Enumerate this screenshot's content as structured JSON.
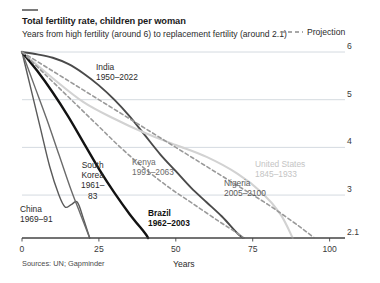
{
  "header": {
    "title": "Total fertility rate, children per woman",
    "subtitle": "Years from high fertility (around 6) to replacement fertility (around 2.1)"
  },
  "legend": {
    "projection_label": "Projection",
    "projection_icon": "dashed-line-icon",
    "projection_color": "#8c8c8c"
  },
  "footer": {
    "source": "Sources: UN; Gapminder"
  },
  "chart_data": {
    "type": "line",
    "title": "Total fertility rate, children per woman",
    "subtitle": "Years from high fertility (around 6) to replacement fertility (around 2.1)",
    "xlabel": "Years",
    "ylabel": "",
    "xlim": [
      0,
      105
    ],
    "ylim": [
      2.1,
      6
    ],
    "xticks": [
      0,
      25,
      50,
      75,
      100
    ],
    "xtick_labels": [
      "0",
      "25",
      "50",
      "75",
      "100"
    ],
    "yticks": [
      2.1,
      3,
      4,
      5,
      6
    ],
    "ytick_labels": [
      "2.1",
      "3",
      "4",
      "5",
      "6"
    ],
    "grid": "horizontal",
    "legend_position": "top-right",
    "series": [
      {
        "name": "India",
        "label": "India",
        "period": "1950–2022",
        "color": "#4a4a4a",
        "style": "solid",
        "width": 1.9,
        "x": [
          0,
          5,
          10,
          15,
          20,
          25,
          30,
          35,
          40,
          45,
          50,
          55,
          60,
          65,
          70,
          72
        ],
        "y": [
          6.0,
          5.95,
          5.88,
          5.75,
          5.55,
          5.3,
          5.0,
          4.65,
          4.25,
          3.85,
          3.5,
          3.15,
          2.85,
          2.55,
          2.2,
          2.1
        ]
      },
      {
        "name": "United States",
        "label": "United States",
        "period": "1845–1933",
        "color": "#d2d2d2",
        "style": "solid",
        "width": 2.1,
        "x": [
          0,
          10,
          20,
          30,
          40,
          50,
          60,
          70,
          78,
          84,
          88
        ],
        "y": [
          6.0,
          5.45,
          4.95,
          4.6,
          4.3,
          4.05,
          3.8,
          3.45,
          3.05,
          2.6,
          2.1
        ]
      },
      {
        "name": "China",
        "label": "China",
        "period": "1969–91",
        "color": "#5a5a5a",
        "style": "solid",
        "width": 1.4,
        "x": [
          0,
          3,
          6,
          9,
          12,
          14,
          16,
          18,
          20,
          22
        ],
        "y": [
          6.0,
          5.2,
          4.4,
          3.6,
          3.0,
          2.75,
          2.8,
          2.85,
          2.5,
          2.1
        ]
      },
      {
        "name": "South Korea",
        "label": "South Korea",
        "period": "1961–83",
        "color": "#6b6b6b",
        "style": "solid",
        "width": 1.4,
        "x": [
          0,
          4,
          8,
          12,
          16,
          19,
          22
        ],
        "y": [
          6.0,
          5.3,
          4.6,
          3.85,
          3.1,
          2.6,
          2.1
        ]
      },
      {
        "name": "Brazil",
        "label": "Brazil",
        "period": "1962–2003",
        "color": "#121212",
        "style": "solid",
        "width": 2.4,
        "x": [
          0,
          5,
          10,
          15,
          20,
          25,
          30,
          35,
          40,
          41
        ],
        "y": [
          6.0,
          5.6,
          5.15,
          4.65,
          4.1,
          3.55,
          3.05,
          2.6,
          2.2,
          2.1
        ]
      },
      {
        "name": "Kenya",
        "label": "Kenya",
        "period": "1991–2063",
        "color": "#9a9a9a",
        "style": "dashed",
        "width": 1.6,
        "x": [
          0,
          8,
          16,
          24,
          32,
          40,
          48,
          56,
          64,
          70,
          72
        ],
        "y": [
          6.0,
          5.5,
          5.0,
          4.5,
          4.0,
          3.55,
          3.15,
          2.8,
          2.45,
          2.2,
          2.1
        ]
      },
      {
        "name": "Nigeria",
        "label": "Nigeria",
        "period": "2005–2100",
        "color": "#9a9a9a",
        "style": "dashed",
        "width": 1.6,
        "x": [
          0,
          10,
          20,
          30,
          40,
          50,
          60,
          70,
          80,
          90,
          95
        ],
        "y": [
          6.0,
          5.6,
          5.2,
          4.8,
          4.4,
          4.0,
          3.6,
          3.2,
          2.8,
          2.35,
          2.1
        ]
      }
    ],
    "annotations": [
      {
        "name": "india",
        "lines": [
          "India",
          "1950–2022"
        ],
        "x": 96,
        "y": 62,
        "color": "#2b2b2b",
        "bold": false,
        "align": "left"
      },
      {
        "name": "united-states",
        "lines": [
          "United States",
          "1845–1933"
        ],
        "x": 255,
        "y": 159,
        "color": "#c4c4c4",
        "bold": false,
        "align": "left"
      },
      {
        "name": "kenya",
        "lines": [
          "Kenya",
          "1991–2063"
        ],
        "x": 132,
        "y": 157,
        "color": "#6b6b6b",
        "bold": false,
        "align": "left"
      },
      {
        "name": "nigeria",
        "lines": [
          "Nigeria",
          "2005–2100"
        ],
        "x": 224,
        "y": 178,
        "color": "#5a5a5a",
        "bold": false,
        "align": "left"
      },
      {
        "name": "south-korea",
        "lines": [
          "South",
          "Korea",
          "1961–",
          "83"
        ],
        "x": 81,
        "y": 160,
        "color": "#2b2b2b",
        "bold": false,
        "align": "center"
      },
      {
        "name": "china",
        "lines": [
          "China",
          "1969–91"
        ],
        "x": 20,
        "y": 204,
        "color": "#2b2b2b",
        "bold": false,
        "align": "left"
      },
      {
        "name": "brazil",
        "lines": [
          "Brazil",
          "1962–2003"
        ],
        "x": 148,
        "y": 208,
        "color": "#111111",
        "bold": true,
        "align": "left"
      }
    ]
  }
}
